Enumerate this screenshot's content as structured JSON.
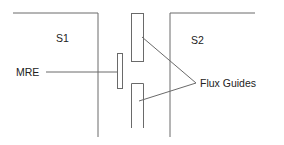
{
  "diagram": {
    "labels": {
      "s1": "S1",
      "s2": "S2",
      "mre": "MRE",
      "flux_guides": "Flux Guides"
    },
    "colors": {
      "line": "#6a6a6a",
      "text": "#222222",
      "background": "#ffffff"
    }
  }
}
